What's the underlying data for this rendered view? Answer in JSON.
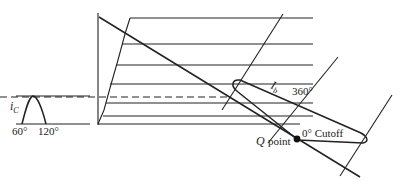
{
  "diagram": {
    "labels": {
      "ic": "i",
      "ic_sub": "C",
      "angle_60": "60°",
      "angle_120": "120°",
      "ib": "I",
      "ib_sub": "b",
      "angle_360": "360°",
      "cutoff": "0° Cutoff",
      "q": "Q",
      "q_point": "point"
    },
    "colors": {
      "stroke": "#222222",
      "background": "#ffffff"
    }
  }
}
